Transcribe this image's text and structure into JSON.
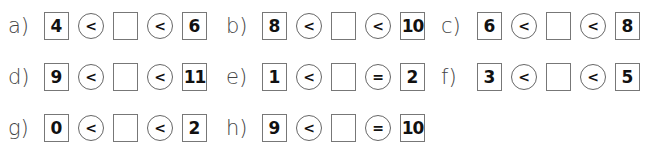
{
  "exercises": [
    {
      "label": "a)",
      "left": "4",
      "op1": "<",
      "op2": "<",
      "right": "6"
    },
    {
      "label": "b)",
      "left": "8",
      "op1": "<",
      "op2": "<",
      "right": "10"
    },
    {
      "label": "c)",
      "left": "6",
      "op1": "<",
      "op2": "<",
      "right": "8"
    },
    {
      "label": "d)",
      "left": "9",
      "op1": "<",
      "op2": "<",
      "right": "11"
    },
    {
      "label": "e)",
      "left": "1",
      "op1": "<",
      "op2": "=",
      "right": "2"
    },
    {
      "label": "f)",
      "left": "3",
      "op1": "<",
      "op2": "<",
      "right": "5"
    },
    {
      "label": "g)",
      "left": "0",
      "op1": "<",
      "op2": "<",
      "right": "2"
    },
    {
      "label": "h)",
      "left": "9",
      "op1": "<",
      "op2": "=",
      "right": "10"
    }
  ],
  "blank_answer": ""
}
